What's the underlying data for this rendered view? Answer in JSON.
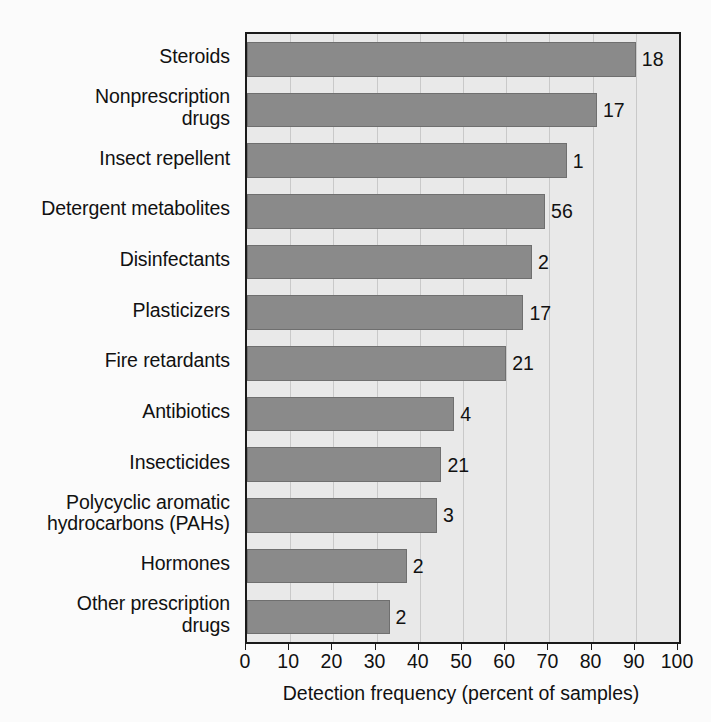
{
  "chart_data": {
    "type": "bar",
    "orientation": "horizontal",
    "title": "",
    "xlabel": "Detection frequency (percent of samples)",
    "ylabel": "",
    "xlim": [
      0,
      100
    ],
    "xticks": [
      0,
      10,
      20,
      30,
      40,
      50,
      60,
      70,
      80,
      90,
      100
    ],
    "xtick_labels": [
      "0",
      "10",
      "20",
      "30",
      "40",
      "50",
      "60",
      "70",
      "80",
      "90",
      "100"
    ],
    "grid": "vertical",
    "legend": "none",
    "categories": [
      "Steroids",
      "Nonprescription\ndrugs",
      "Insect repellent",
      "Detergent metabolites",
      "Disinfectants",
      "Plasticizers",
      "Fire retardants",
      "Antibiotics",
      "Insecticides",
      "Polycyclic aromatic\nhydrocarbons (PAHs)",
      "Hormones",
      "Other prescription\ndrugs"
    ],
    "values": [
      90,
      81,
      74,
      69,
      66,
      64,
      60,
      48,
      45,
      44,
      37,
      33
    ],
    "data_labels": [
      "18",
      "17",
      "1",
      "56",
      "2",
      "17",
      "21",
      "4",
      "21",
      "3",
      "2",
      "2"
    ],
    "bars": [
      {
        "category": "Steroids",
        "value": 90,
        "label": "18"
      },
      {
        "category": "Nonprescription drugs",
        "value": 81,
        "label": "17"
      },
      {
        "category": "Insect repellent",
        "value": 74,
        "label": "1"
      },
      {
        "category": "Detergent metabolites",
        "value": 69,
        "label": "56"
      },
      {
        "category": "Disinfectants",
        "value": 66,
        "label": "2"
      },
      {
        "category": "Plasticizers",
        "value": 64,
        "label": "17"
      },
      {
        "category": "Fire retardants",
        "value": 60,
        "label": "21"
      },
      {
        "category": "Antibiotics",
        "value": 48,
        "label": "4"
      },
      {
        "category": "Insecticides",
        "value": 45,
        "label": "21"
      },
      {
        "category": "Polycyclic aromatic hydrocarbons (PAHs)",
        "value": 44,
        "label": "3"
      },
      {
        "category": "Hormones",
        "value": 37,
        "label": "2"
      },
      {
        "category": "Other prescription drugs",
        "value": 33,
        "label": "2"
      }
    ],
    "colors": {
      "bar_fill": "#8a8a8a",
      "bar_border": "#6f6f6f",
      "plot_background": "#e9e9e9",
      "page_background": "#fbfbfb",
      "axis": "#1a1a1a",
      "gridline": "#c9c9c9",
      "text": "#111111"
    }
  }
}
